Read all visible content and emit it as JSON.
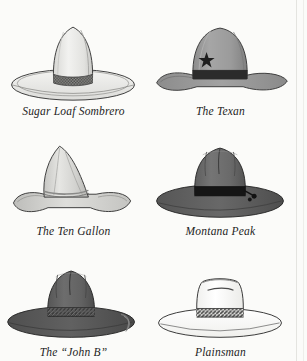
{
  "page": {
    "background_color": "#fbfbf9",
    "caption_color": "#1d1d1d",
    "columns": 2,
    "rows": 3
  },
  "hats": [
    {
      "id": "sugar-loaf-sombrero",
      "label": "Sugar Loaf Sombrero",
      "crown_shape": "tall conical sugarloaf",
      "crown_color": "#e8e8e6",
      "brim_shape": "wide flat oval",
      "brim_color": "#f2f2f0",
      "band_style": "woven checkered braid",
      "band_color": "#5a5a5a",
      "outline_color": "#3a3a3a"
    },
    {
      "id": "the-texan",
      "label": "The Texan",
      "crown_shape": "tall rounded dome",
      "crown_color": "#9a9a9a",
      "brim_shape": "upcurved wide",
      "brim_color": "#8e8e8e",
      "band_style": "plain ribbon",
      "band_color": "#2b2b2b",
      "ornament": "five-pointed star",
      "ornament_color": "#1f1f1f",
      "outline_color": "#3a3a3a"
    },
    {
      "id": "the-ten-gallon",
      "label": "The Ten Gallon",
      "crown_shape": "tall forward-leaning peak",
      "crown_color": "#d9d9d6",
      "brim_shape": "wavy rolled",
      "brim_color": "#cfcfcc",
      "band_style": "thin cord",
      "band_color": "#8a8a88",
      "outline_color": "#3a3a3a"
    },
    {
      "id": "montana-peak",
      "label": "Montana Peak",
      "crown_shape": "four-dent pinched peak",
      "crown_color": "#6c6c6c",
      "brim_shape": "flat wide",
      "brim_color": "#5e5e5e",
      "band_style": "plain ribbon with buckle",
      "band_color": "#151515",
      "ornament": "side buckle",
      "ornament_color": "#121212",
      "outline_color": "#2a2a2a"
    },
    {
      "id": "the-john-b",
      "label": "The “John B”",
      "crown_shape": "center-creased fedora",
      "crown_color": "#646464",
      "brim_shape": "wide flat with slight curl",
      "brim_color": "#5a5a5a",
      "band_style": "braided cord",
      "band_color": "#3c3c3c",
      "ornament": "hanging chin cord",
      "ornament_color": "#777777",
      "outline_color": "#2a2a2a"
    },
    {
      "id": "plainsman",
      "label": "Plainsman",
      "crown_shape": "flat-top telescope",
      "crown_color": "#fdfdfc",
      "brim_shape": "wide flat oval",
      "brim_color": "#fdfdfc",
      "band_style": "dark hatched stripe",
      "band_color": "#4a4a4a",
      "outline_color": "#333333"
    }
  ]
}
